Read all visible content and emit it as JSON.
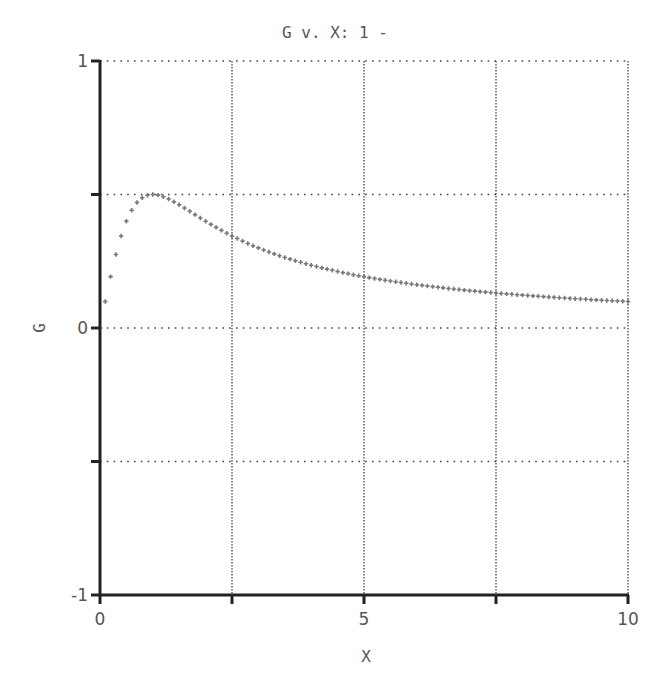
{
  "chart_data": {
    "type": "scatter",
    "title": "G v. X: 1 -",
    "xlabel": "X",
    "ylabel": "G",
    "xlim": [
      0,
      10
    ],
    "ylim": [
      -1,
      1
    ],
    "grid": true,
    "legend": null,
    "x_ticks": [
      0,
      2.5,
      5,
      7.5,
      10
    ],
    "x_tick_labels": [
      "0",
      "",
      "5",
      "",
      "10"
    ],
    "y_ticks": [
      -1,
      -0.5,
      0,
      0.5,
      1
    ],
    "y_tick_labels": [
      "-1",
      "",
      "0",
      "",
      "1"
    ],
    "series": [
      {
        "name": "G",
        "marker": "+",
        "color": "#777777",
        "description": "G ≈ X/(1+X²), sampled every 0.1 from 0 to 10; peak ≈0.5 at X≈1",
        "x": [
          0,
          0.1,
          0.2,
          0.3,
          0.4,
          0.5,
          0.6,
          0.7,
          0.8,
          0.9,
          1.0,
          1.2,
          1.4,
          1.6,
          1.8,
          2.0,
          2.5,
          3.0,
          3.5,
          4.0,
          4.5,
          5.0,
          5.5,
          6.0,
          6.5,
          7.0,
          7.5,
          8.0,
          8.5,
          9.0,
          9.5,
          10.0
        ],
        "y": [
          0,
          0.099,
          0.192,
          0.275,
          0.345,
          0.4,
          0.441,
          0.47,
          0.488,
          0.497,
          0.5,
          0.492,
          0.473,
          0.449,
          0.425,
          0.4,
          0.345,
          0.3,
          0.264,
          0.235,
          0.212,
          0.192,
          0.176,
          0.162,
          0.15,
          0.14,
          0.131,
          0.123,
          0.116,
          0.11,
          0.104,
          0.099
        ]
      }
    ]
  },
  "colors": {
    "axis": "#222222",
    "grid": "#444444",
    "marker": "#777777",
    "text": "#555555"
  }
}
